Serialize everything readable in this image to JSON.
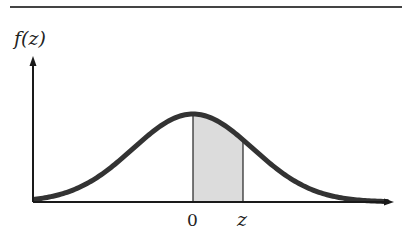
{
  "figure": {
    "type": "standard-normal-density",
    "y_axis_label": "f(z)",
    "x_tick_labels": [
      "0",
      "z"
    ],
    "shaded_region": {
      "from": "0",
      "to": "z"
    },
    "colors": {
      "curve": "#333333",
      "axis": "#1a1a1a",
      "shade": "#dcdcdc",
      "rule": "#444444"
    }
  }
}
